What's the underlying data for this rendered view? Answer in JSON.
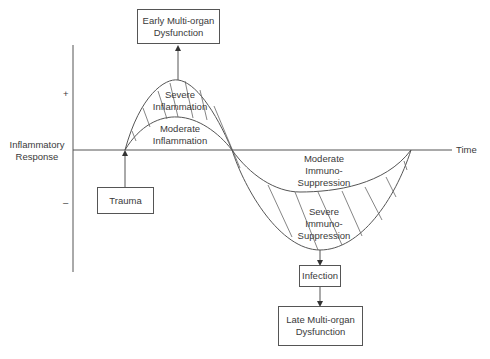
{
  "axes": {
    "y_label": "Inflammatory\nResponse",
    "x_label": "Time",
    "plus_mark": "+",
    "minus_mark": "–"
  },
  "regions": {
    "severe_inflammation": "Severe\nInflammation",
    "moderate_inflammation": "Moderate\nInflammation",
    "moderate_immunosuppression": "Moderate\nImmuno-\nSuppression",
    "severe_immunosuppression": "Severe\nImmuno-\nSuppression"
  },
  "boxes": {
    "early_mod": "Early Multi-organ\nDysfunction",
    "trauma": "Trauma",
    "infection": "Infection",
    "late_mod": "Late Multi-organ\nDysfunction"
  },
  "colors": {
    "line": "#555555",
    "text": "#3a3a3a"
  }
}
